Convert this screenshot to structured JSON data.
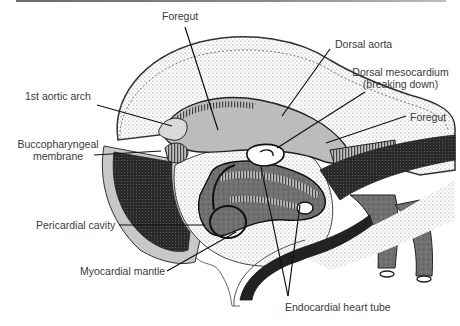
{
  "figure": {
    "labels": {
      "foregut_top": "Foregut",
      "dorsal_aorta": "Dorsal aorta",
      "dorsal_mesocardium_line1": "Dorsal mesocardium",
      "dorsal_mesocardium_line2": "(breaking down)",
      "foregut_right": "Foregut",
      "first_aortic_arch": "1st aortic arch",
      "buccopharyngeal_line1": "Buccopharyngeal",
      "buccopharyngeal_line2": "membrane",
      "pericardial_cavity": "Pericardial cavity",
      "myocardial_mantle": "Myocardial mantle",
      "endocardial_heart_tube": "Endocardial heart tube"
    },
    "colors": {
      "ink": "#1a1a1a",
      "label_text": "#3a3a3a",
      "light_gray": "#c8c8c8",
      "mid_gray": "#9a9a9a",
      "dark_gray": "#555555",
      "near_black": "#222222",
      "background": "#ffffff"
    }
  }
}
